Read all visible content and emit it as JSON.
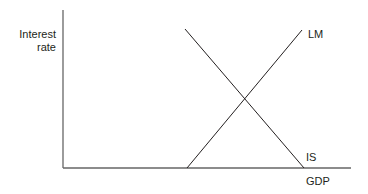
{
  "diagram": {
    "y_axis_label_line1": "Interest",
    "y_axis_label_line2": "rate",
    "x_axis_label": "GDP",
    "curves": [
      {
        "name": "LM",
        "slope": "upward"
      },
      {
        "name": "IS",
        "slope": "downward"
      }
    ],
    "line_color": "#231f20",
    "axis_color": "#555555"
  }
}
